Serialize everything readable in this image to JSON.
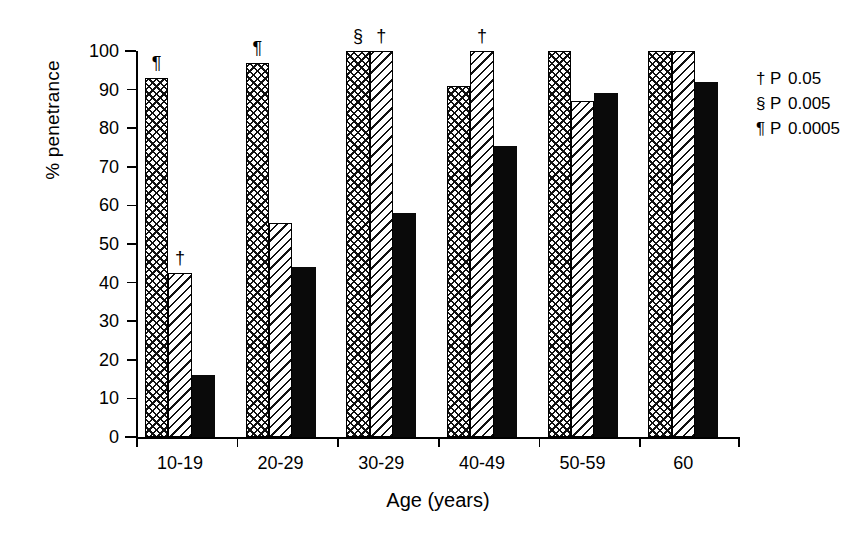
{
  "chart_data": {
    "type": "bar",
    "title": "",
    "xlabel": "Age (years)",
    "ylabel": "% penetrance",
    "ylim": [
      0,
      100
    ],
    "yticks": [
      0,
      10,
      20,
      30,
      40,
      50,
      60,
      70,
      80,
      90,
      100
    ],
    "grid": false,
    "legend_position": "right",
    "categories": [
      "10-19",
      "20-29",
      "30-29",
      "40-49",
      "50-59",
      "60"
    ],
    "series": [
      {
        "name": "crosshatch",
        "pattern": "crosshatch",
        "values": [
          93,
          97,
          100,
          91,
          100,
          100
        ]
      },
      {
        "name": "diagonal",
        "pattern": "diagonal",
        "values": [
          42.5,
          55.5,
          100,
          100,
          87,
          100
        ]
      },
      {
        "name": "solid",
        "pattern": "solid",
        "values": [
          16,
          44,
          58,
          75.5,
          89,
          92
        ]
      }
    ],
    "annotations": [
      {
        "group": 0,
        "series": 0,
        "symbol": "¶"
      },
      {
        "group": 0,
        "series": 1,
        "symbol": "†"
      },
      {
        "group": 1,
        "series": 0,
        "symbol": "¶"
      },
      {
        "group": 2,
        "series": 0,
        "symbol": "§"
      },
      {
        "group": 2,
        "series": 1,
        "symbol": "†"
      },
      {
        "group": 3,
        "series": 1,
        "symbol": "†"
      }
    ]
  },
  "legend": {
    "rows": [
      {
        "symbol": "†",
        "p": "P",
        "value": "0.05"
      },
      {
        "symbol": "§",
        "p": "P",
        "value": "0.005"
      },
      {
        "symbol": "¶",
        "p": "P",
        "value": "0.0005"
      }
    ]
  },
  "colors": {
    "ink": "#000000",
    "background": "#ffffff",
    "solid_bar": "#0a0a0a"
  }
}
